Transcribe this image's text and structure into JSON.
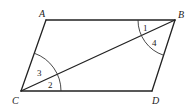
{
  "figure": {
    "type": "parallelogram-with-diagonal",
    "vertices": {
      "A": {
        "label": "A",
        "x": 46,
        "y": 20
      },
      "B": {
        "label": "B",
        "x": 175,
        "y": 20
      },
      "C": {
        "label": "C",
        "x": 21,
        "y": 91
      },
      "D": {
        "label": "D",
        "x": 152,
        "y": 91
      }
    },
    "segments": [
      "AB",
      "BD",
      "DC",
      "CA",
      "CB"
    ],
    "angles": [
      {
        "label": "1",
        "vertex": "B",
        "between": [
          "BA",
          "BC"
        ]
      },
      {
        "label": "4",
        "vertex": "B",
        "between": [
          "BC",
          "BD"
        ]
      },
      {
        "label": "3",
        "vertex": "C",
        "between": [
          "CA",
          "CB"
        ]
      },
      {
        "label": "2",
        "vertex": "C",
        "between": [
          "CB",
          "CD"
        ]
      }
    ]
  }
}
